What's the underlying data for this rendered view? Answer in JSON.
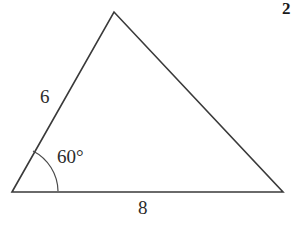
{
  "figure": {
    "type": "geometry-diagram",
    "shape": "triangle",
    "background_color": "#ffffff",
    "stroke_color": "#3a3a3a",
    "stroke_width": 1.6,
    "vertices": {
      "left": {
        "x": 12,
        "y": 192
      },
      "apex": {
        "x": 114,
        "y": 12
      },
      "right": {
        "x": 283,
        "y": 192
      }
    },
    "arc": {
      "name": "angle-arc-left-vertex",
      "center": {
        "x": 12,
        "y": 192
      },
      "radius": 46,
      "start": {
        "x": 33,
        "y": 151
      },
      "end": {
        "x": 58,
        "y": 191
      }
    },
    "labels": {
      "side_left": "6",
      "side_base": "8",
      "angle": "60°",
      "problem_number": "2"
    }
  }
}
